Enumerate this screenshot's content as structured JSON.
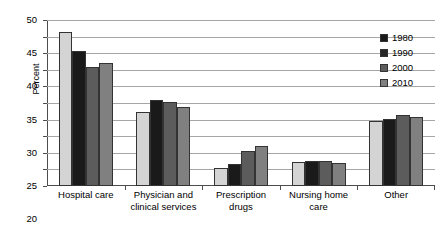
{
  "chart_data": {
    "type": "bar",
    "title": "",
    "subtitle": "",
    "xlabel": "",
    "ylabel": "Percent",
    "ylim": [
      0,
      50
    ],
    "ytick_step": 5,
    "yticks": [
      0,
      5,
      10,
      15,
      20,
      25,
      30,
      35,
      40,
      45,
      50
    ],
    "ytick_labels": [
      "0",
      "5",
      "10",
      "15",
      "20",
      "25",
      "30",
      "35",
      "40",
      "45",
      "50"
    ],
    "grid": true,
    "legend_position": "top-right",
    "categories": [
      "Hospital care",
      "Physician and clinical services",
      "Prescription drugs",
      "Nursing home care",
      "Other"
    ],
    "category_lines": [
      [
        "Hospital care"
      ],
      [
        "Physician and",
        "clinical services"
      ],
      [
        "Prescription",
        "drugs"
      ],
      [
        "Nursing home",
        "care"
      ],
      [
        "Other"
      ]
    ],
    "series": [
      {
        "name": "1980",
        "color": "#d4d4d4",
        "values": [
          46.4,
          22.2,
          5.5,
          7.3,
          19.6
        ]
      },
      {
        "name": "1990",
        "color": "#1a1a1a",
        "values": [
          40.6,
          26.0,
          6.6,
          7.4,
          20.1
        ]
      },
      {
        "name": "2000",
        "color": "#5c5c5c",
        "values": [
          35.7,
          25.3,
          10.5,
          7.4,
          21.5
        ]
      },
      {
        "name": "2010",
        "color": "#808080",
        "values": [
          37.2,
          23.7,
          12.0,
          6.8,
          20.9
        ]
      }
    ]
  },
  "legend": {
    "items": [
      {
        "label": "1980",
        "color": "#1a1a1a"
      },
      {
        "label": "1990",
        "color": "#262626"
      },
      {
        "label": "2000",
        "color": "#5c5c5c"
      },
      {
        "label": "2010",
        "color": "#808080"
      }
    ]
  },
  "colors": {
    "axis": "#4d4d4d",
    "grid": "#a6a6a6",
    "bar_outline": "#333333",
    "background": "#ffffff",
    "text": "#000000"
  }
}
